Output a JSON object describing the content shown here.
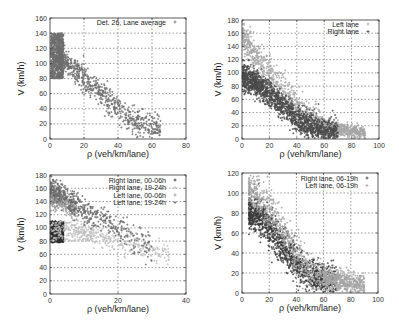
{
  "chart_data": [
    {
      "id": "panel-top-left",
      "type": "scatter",
      "title": "",
      "xlabel": "ρ (veh/km/lane)",
      "ylabel": "V (km/h)",
      "xlim": [
        0,
        80
      ],
      "ylim": [
        0,
        160
      ],
      "xticks": [
        0,
        20,
        40,
        60,
        80
      ],
      "yticks": [
        0,
        20,
        40,
        60,
        80,
        100,
        120,
        140,
        160
      ],
      "grid": true,
      "legend_position": "top-right",
      "series": [
        {
          "name": "Det. 26, Lane average",
          "color": "#6e6e6e",
          "marker": "+",
          "n": 1400,
          "clouds": [
            {
              "x": [
                0.5,
                8
              ],
              "y": [
                80,
                140
              ],
              "shape": "free"
            },
            {
              "x": [
                5,
                65
              ],
              "vAt": [
                [
                  5,
                  110
                ],
                [
                  20,
                  80
                ],
                [
                  35,
                  50
                ],
                [
                  50,
                  20
                ],
                [
                  70,
                  10
                ]
              ],
              "spread": 9
            }
          ],
          "sample_points": [
            [
              3,
              130
            ],
            [
              5,
              120
            ],
            [
              2,
              95
            ],
            [
              10,
              95
            ],
            [
              20,
              78
            ],
            [
              30,
              58
            ],
            [
              40,
              32
            ],
            [
              50,
              18
            ],
            [
              60,
              14
            ],
            [
              70,
              8
            ]
          ]
        }
      ]
    },
    {
      "id": "panel-top-right",
      "type": "scatter",
      "title": "",
      "xlabel": "ρ (veh/km/lane)",
      "ylabel": "V (km/h)",
      "xlim": [
        0,
        100
      ],
      "ylim": [
        0,
        180
      ],
      "xticks": [
        0,
        20,
        40,
        60,
        80,
        100
      ],
      "yticks": [
        0,
        20,
        40,
        60,
        80,
        100,
        120,
        140,
        160,
        180
      ],
      "grid": true,
      "legend_position": "top-right",
      "series": [
        {
          "name": "Left lane",
          "color": "#a8a8a8",
          "marker": "+",
          "n": 1300,
          "clouds": [
            {
              "x": [
                0.5,
                60
              ],
              "vAt": [
                [
                  0,
                  160
                ],
                [
                  10,
                  125
                ],
                [
                  20,
                  100
                ],
                [
                  30,
                  75
                ],
                [
                  45,
                  40
                ],
                [
                  60,
                  18
                ]
              ],
              "spread": 12
            },
            {
              "x": [
                55,
                90
              ],
              "vAt": [
                [
                  55,
                  20
                ],
                [
                  90,
                  8
                ]
              ],
              "spread": 5
            }
          ],
          "sample_points": [
            [
              2,
              160
            ],
            [
              8,
              135
            ],
            [
              15,
              115
            ],
            [
              25,
              88
            ],
            [
              35,
              62
            ],
            [
              50,
              28
            ],
            [
              70,
              12
            ],
            [
              88,
              8
            ]
          ]
        },
        {
          "name": "Right lane",
          "color": "#4a4a4a",
          "marker": "+",
          "n": 1500,
          "clouds": [
            {
              "x": [
                0.5,
                70
              ],
              "vAt": [
                [
                  0,
                  95
                ],
                [
                  10,
                  85
                ],
                [
                  20,
                  70
                ],
                [
                  30,
                  50
                ],
                [
                  40,
                  30
                ],
                [
                  55,
                  15
                ],
                [
                  70,
                  8
                ]
              ],
              "spread": 10
            }
          ],
          "sample_points": [
            [
              2,
              95
            ],
            [
              10,
              85
            ],
            [
              20,
              68
            ],
            [
              30,
              48
            ],
            [
              40,
              30
            ],
            [
              55,
              15
            ],
            [
              70,
              8
            ],
            [
              80,
              5
            ]
          ]
        }
      ]
    },
    {
      "id": "panel-bottom-left",
      "type": "scatter",
      "title": "",
      "xlabel": "ρ (veh/km/lane)",
      "ylabel": "V (km/h)",
      "xlim": [
        0,
        40
      ],
      "ylim": [
        0,
        180
      ],
      "xticks": [
        0,
        20,
        40
      ],
      "yticks": [
        0,
        20,
        40,
        60,
        80,
        100,
        120,
        140,
        160,
        180
      ],
      "grid": true,
      "legend_position": "top-right",
      "series": [
        {
          "name": "Right lane, 00-06h",
          "color": "#2e2e2e",
          "marker": "+",
          "n": 500,
          "clouds": [
            {
              "x": [
                0.2,
                4
              ],
              "y": [
                78,
                110
              ],
              "shape": "free"
            }
          ],
          "sample_points": [
            [
              0.5,
              95
            ],
            [
              1.5,
              88
            ],
            [
              2.5,
              82
            ],
            [
              3.5,
              80
            ]
          ]
        },
        {
          "name": "Right lane, 19-24h",
          "color": "#c2c2c2",
          "marker": "+",
          "n": 450,
          "clouds": [
            {
              "x": [
                0.3,
                12
              ],
              "y": [
                80,
                110
              ],
              "shape": "free"
            },
            {
              "x": [
                12,
                35
              ],
              "vAt": [
                [
                  12,
                  90
                ],
                [
                  20,
                  80
                ],
                [
                  28,
                  68
                ],
                [
                  35,
                  58
                ]
              ],
              "spread": 8
            }
          ],
          "sample_points": [
            [
              4,
              95
            ],
            [
              8,
              88
            ],
            [
              15,
              85
            ],
            [
              25,
              70
            ],
            [
              33,
              60
            ]
          ]
        },
        {
          "name": "Left lane, 00-06h",
          "color": "#9a9a9a",
          "marker": "+",
          "n": 350,
          "clouds": [
            {
              "x": [
                0.2,
                8
              ],
              "vAt": [
                [
                  0,
                  150
                ],
                [
                  4,
                  140
                ],
                [
                  8,
                  128
                ]
              ],
              "spread": 9
            }
          ],
          "sample_points": [
            [
              1,
              150
            ],
            [
              3,
              143
            ],
            [
              6,
              132
            ]
          ]
        },
        {
          "name": "Left lane, 19-24h",
          "color": "#6a6a6a",
          "marker": "+",
          "n": 450,
          "clouds": [
            {
              "x": [
                0.3,
                10
              ],
              "vAt": [
                [
                  0,
                  162
                ],
                [
                  4,
                  148
                ],
                [
                  10,
                  128
                ]
              ],
              "spread": 9
            },
            {
              "x": [
                10,
                30
              ],
              "vAt": [
                [
                  10,
                  125
                ],
                [
                  20,
                  100
                ],
                [
                  30,
                  68
                ]
              ],
              "spread": 10
            }
          ],
          "sample_points": [
            [
              2,
              158
            ],
            [
              5,
              145
            ],
            [
              12,
              122
            ],
            [
              20,
              100
            ],
            [
              28,
              70
            ]
          ]
        }
      ]
    },
    {
      "id": "panel-bottom-right",
      "type": "scatter",
      "title": "",
      "xlabel": "ρ (veh/km/lane)",
      "ylabel": "V (km/h)",
      "xlim": [
        0,
        100
      ],
      "ylim": [
        0,
        120
      ],
      "xticks": [
        0,
        20,
        40,
        60,
        80,
        100
      ],
      "yticks": [
        0,
        20,
        40,
        60,
        80,
        100,
        120
      ],
      "grid": true,
      "legend_position": "top-right",
      "series": [
        {
          "name": "Right lane, 06-19h",
          "color": "#3c3c3c",
          "marker": "+",
          "n": 1300,
          "clouds": [
            {
              "x": [
                5,
                70
              ],
              "vAt": [
                [
                  5,
                  82
                ],
                [
                  15,
                  75
                ],
                [
                  25,
                  55
                ],
                [
                  35,
                  38
                ],
                [
                  45,
                  22
                ],
                [
                  55,
                  14
                ],
                [
                  70,
                  8
                ]
              ],
              "spread": 9
            }
          ],
          "sample_points": [
            [
              6,
              82
            ],
            [
              15,
              75
            ],
            [
              25,
              55
            ],
            [
              35,
              38
            ],
            [
              45,
              22
            ],
            [
              55,
              14
            ],
            [
              70,
              8
            ]
          ]
        },
        {
          "name": "Left lane, 06-19h",
          "color": "#a6a6a6",
          "marker": "+",
          "n": 1100,
          "clouds": [
            {
              "x": [
                5,
                60
              ],
              "vAt": [
                [
                  5,
                  105
                ],
                [
                  12,
                  98
                ],
                [
                  20,
                  82
                ],
                [
                  30,
                  60
                ],
                [
                  40,
                  40
                ],
                [
                  50,
                  22
                ],
                [
                  60,
                  15
                ]
              ],
              "spread": 10
            },
            {
              "x": [
                60,
                90
              ],
              "vAt": [
                [
                  60,
                  15
                ],
                [
                  90,
                  8
                ]
              ],
              "spread": 5
            }
          ],
          "sample_points": [
            [
              6,
              108
            ],
            [
              12,
              98
            ],
            [
              20,
              82
            ],
            [
              30,
              60
            ],
            [
              40,
              40
            ],
            [
              55,
              18
            ],
            [
              75,
              10
            ],
            [
              90,
              8
            ]
          ]
        }
      ]
    }
  ]
}
